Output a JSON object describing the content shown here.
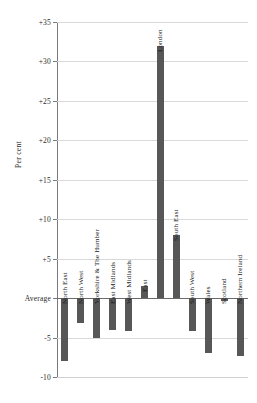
{
  "chart_data": {
    "type": "bar",
    "title": "",
    "subtitle": "",
    "xlabel": "",
    "ylabel": "Per cent",
    "ylim": [
      -10,
      35
    ],
    "ytick_step": 5,
    "ytick_labels": [
      "+35",
      "+30",
      "+25",
      "+20",
      "+15",
      "+10",
      "+5",
      "Average",
      "-5",
      "-10"
    ],
    "ytick_values": [
      35,
      30,
      25,
      20,
      15,
      10,
      5,
      0,
      -5,
      -10
    ],
    "zero_line_label": "Average",
    "grid": true,
    "legend": "none",
    "bar_color": "#575757",
    "categories": [
      "North East",
      "North West",
      "Yorkshire & The Humber",
      "East Midlands",
      "West Midlands",
      "East",
      "London",
      "South East",
      "South West",
      "Wales",
      "Scotland",
      "Northern Ireland"
    ],
    "values": [
      -8.0,
      -3.2,
      -5.1,
      -4.0,
      -4.2,
      1.5,
      32.0,
      8.0,
      -4.2,
      -7.0,
      -0.4,
      -7.4
    ]
  }
}
